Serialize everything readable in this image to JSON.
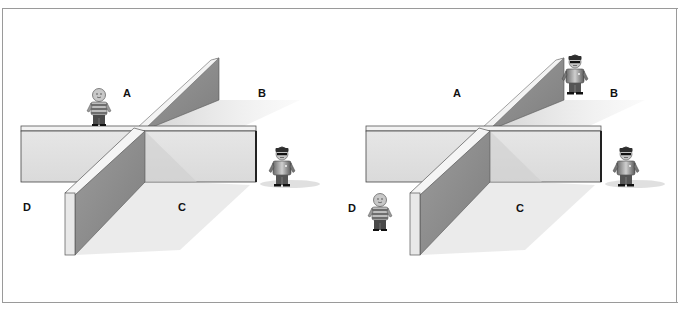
{
  "figure": {
    "panels": [
      {
        "id": "left",
        "labels": [
          "A",
          "B",
          "C",
          "D"
        ],
        "figures": [
          {
            "type": "boy",
            "region": "A"
          },
          {
            "type": "policeman",
            "region": "B-C side"
          }
        ]
      },
      {
        "id": "right",
        "labels": [
          "A",
          "B",
          "C",
          "D"
        ],
        "figures": [
          {
            "type": "policeman",
            "region": "B"
          },
          {
            "type": "policeman",
            "region": "B-C side"
          },
          {
            "type": "boy",
            "region": "D"
          }
        ]
      }
    ]
  },
  "labels": {
    "left": {
      "a": "A",
      "b": "B",
      "c": "C",
      "d": "D"
    },
    "right": {
      "a": "A",
      "b": "B",
      "c": "C",
      "d": "D"
    }
  },
  "colors": {
    "frame": "#9a9a9a",
    "wall_face": "#e2e2e2",
    "wall_side": "#8a8a8a",
    "wall_top": "#f2f2f2",
    "shadow": "#d6d6d6"
  }
}
